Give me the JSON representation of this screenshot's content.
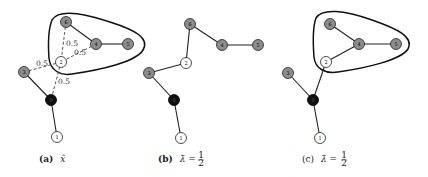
{
  "colors": {
    "gray_node": "#8c8c8c",
    "white_node": "#ffffff",
    "black_node": "#111111",
    "stroke": "#222222"
  },
  "panels": [
    {
      "id": "a",
      "caption_tag": "(a)",
      "caption_math": "x̂",
      "nodes": [
        {
          "label": "6",
          "fill": "gray"
        },
        {
          "label": "4",
          "fill": "gray"
        },
        {
          "label": "5",
          "fill": "gray"
        },
        {
          "label": "2",
          "fill": "white"
        },
        {
          "label": "3",
          "fill": "gray"
        },
        {
          "label": "0",
          "fill": "black"
        },
        {
          "label": "1",
          "fill": "white"
        }
      ],
      "edge_weights": [
        "0.5",
        "0.5",
        "0.5",
        "0.5"
      ]
    },
    {
      "id": "b",
      "caption_tag": "(b)",
      "caption_math": "λ̄ = ",
      "caption_frac_num": "1",
      "caption_frac_den": "2"
    },
    {
      "id": "c",
      "caption_tag": "(c)",
      "caption_math": "λ̄ = ",
      "caption_frac_num": "1",
      "caption_frac_den": "2"
    }
  ]
}
